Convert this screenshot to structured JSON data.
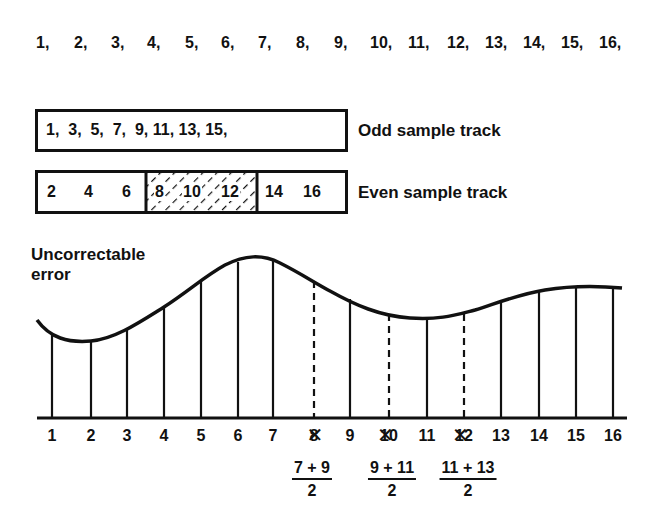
{
  "sequence": {
    "items": [
      "1,",
      "2,",
      "3,",
      "4,",
      "5,",
      "6,",
      "7,",
      "8,",
      "9,",
      "10,",
      "11,",
      "12,",
      "13,",
      "14,",
      "15,",
      "16,"
    ],
    "x": [
      36,
      74,
      111,
      147,
      185,
      221,
      258,
      296,
      334,
      370,
      408,
      447,
      485,
      523,
      561,
      599
    ]
  },
  "odd_track": {
    "label": "Odd sample track",
    "contents": "1,  3,  5,  7,  9, 11, 13, 15,"
  },
  "even_track": {
    "label": "Even sample track",
    "left_values": [
      "2",
      "4",
      "6"
    ],
    "damaged_values": [
      "8",
      "10",
      "12"
    ],
    "right_values": [
      "14",
      "16"
    ]
  },
  "waveform": {
    "title_line1": "Uncorrectable",
    "title_line2": "error",
    "samples": [
      {
        "n": "1",
        "x": 52,
        "top": 335,
        "dashed": false
      },
      {
        "n": "2",
        "x": 91,
        "top": 341,
        "dashed": false
      },
      {
        "n": "3",
        "x": 127,
        "top": 329,
        "dashed": false
      },
      {
        "n": "4",
        "x": 164,
        "top": 307,
        "dashed": false
      },
      {
        "n": "5",
        "x": 201,
        "top": 280,
        "dashed": false
      },
      {
        "n": "6",
        "x": 238,
        "top": 262,
        "dashed": false
      },
      {
        "n": "7",
        "x": 273,
        "top": 261,
        "dashed": false
      },
      {
        "n": "8",
        "x": 314,
        "top": 281,
        "dashed": true
      },
      {
        "n": "9",
        "x": 350,
        "top": 299,
        "dashed": false
      },
      {
        "n": "10",
        "x": 389,
        "top": 314,
        "dashed": true
      },
      {
        "n": "11",
        "x": 427,
        "top": 318,
        "dashed": false
      },
      {
        "n": "12",
        "x": 464,
        "top": 314,
        "dashed": true
      },
      {
        "n": "13",
        "x": 501,
        "top": 301,
        "dashed": false
      },
      {
        "n": "14",
        "x": 539,
        "top": 292,
        "dashed": false
      },
      {
        "n": "15",
        "x": 576,
        "top": 287,
        "dashed": false
      },
      {
        "n": "16",
        "x": 613,
        "top": 288,
        "dashed": false
      }
    ],
    "crossed_out": [
      "8",
      "10",
      "12"
    ]
  },
  "interpolations": [
    {
      "numerator": "7 + 9",
      "denominator": "2",
      "x": 312
    },
    {
      "numerator": "9 + 11",
      "denominator": "2",
      "x": 392
    },
    {
      "numerator": "11 + 13",
      "denominator": "2",
      "x": 468
    }
  ]
}
